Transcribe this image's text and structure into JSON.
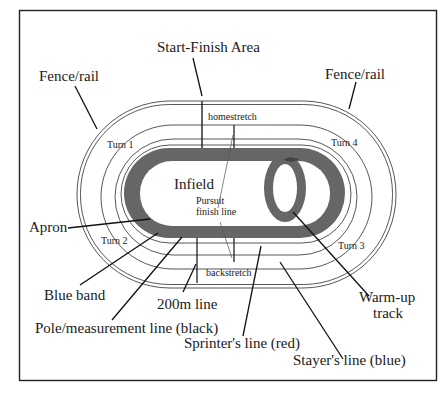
{
  "diagram": {
    "colors": {
      "background": "#ffffff",
      "frame": "#222222",
      "band": "#666666",
      "lines": "#444444",
      "text": "#1a1a1a"
    },
    "labels": {
      "start_finish": "Start-Finish Area",
      "fence_left": "Fence/rail",
      "fence_right": "Fence/rail",
      "homestretch": "homestretch",
      "backstretch": "backstretch",
      "turn1": "Turn 1",
      "turn2": "Turn 2",
      "turn3": "Turn 3",
      "turn4": "Turn 4",
      "infield": "Infield",
      "pursuit_line1": "Pursuit",
      "pursuit_line2": "finish line",
      "apron": "Apron",
      "blue_band": "Blue band",
      "line_200m": "200m line",
      "pole_line": "Pole/measurement line (black)",
      "sprinter_line": "Sprinter's line (red)",
      "stayer_line": "Stayer's line (blue)",
      "warmup_line1": "Warm-up",
      "warmup_line2": "track"
    }
  }
}
